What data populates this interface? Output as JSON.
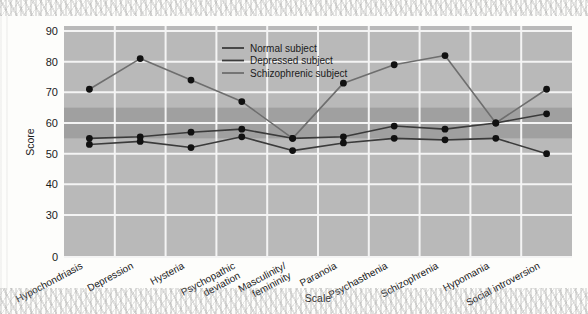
{
  "chart_data": {
    "type": "line",
    "title": "",
    "xlabel": "Scale",
    "ylabel": "Score",
    "ylim": [
      0,
      90
    ],
    "yticks": [
      90,
      80,
      70,
      60,
      50,
      40,
      30,
      0
    ],
    "axis_break": true,
    "axis_break_note": "y-axis breaks between 30 and 0",
    "grid": true,
    "legend_position": "top-center-right",
    "normal_band": {
      "low": 55,
      "high": 65,
      "label": ""
    },
    "categories": [
      "Hypochondriasis",
      "Depression",
      "Hysteria",
      "Psychopathic\ndeviation",
      "Masculinity/\nfemininity",
      "Paranoia",
      "Psychasthenia",
      "Schizophrenia",
      "Hypomania",
      "Social introversion"
    ],
    "series": [
      {
        "name": "Normal subject",
        "color": "#3b3b3b",
        "values": [
          53,
          54,
          52,
          55.5,
          51,
          53.5,
          55,
          54.5,
          55,
          50
        ]
      },
      {
        "name": "Depressed subject",
        "color": "#3b3b3b",
        "values": [
          55,
          55.5,
          57,
          58,
          55,
          55.5,
          59,
          58,
          60,
          63
        ]
      },
      {
        "name": "Schizophrenic subject",
        "color": "#6e6e6e",
        "values": [
          71,
          81,
          74,
          67,
          55,
          73,
          79,
          82,
          60,
          71
        ]
      }
    ]
  },
  "legend": {
    "items": [
      {
        "label": "Normal subject"
      },
      {
        "label": "Depressed subject"
      },
      {
        "label": "Schizophrenic subject"
      }
    ]
  },
  "axes": {
    "y_title": "Score",
    "x_title": "Scale",
    "y_tick_labels": [
      "90",
      "80",
      "70",
      "60",
      "50",
      "40",
      "30",
      "0"
    ],
    "x_tick_labels": [
      "Hypochondriasis",
      "Depression",
      "Hysteria",
      "Psychopathic",
      "deviation",
      "Masculinity/",
      "femininity",
      "Paranoia",
      "Psychasthenia",
      "Schizophrenia",
      "Hypomania",
      "Social introversion"
    ]
  },
  "colors": {
    "plot_background": "#b9b9b9",
    "band_background": "#a0a0a0",
    "gridline": "#f2f2f2",
    "dark_series": "#3b3b3b",
    "light_series": "#6e6e6e",
    "marker": "#111111",
    "page_background": "#fdfdfb"
  }
}
